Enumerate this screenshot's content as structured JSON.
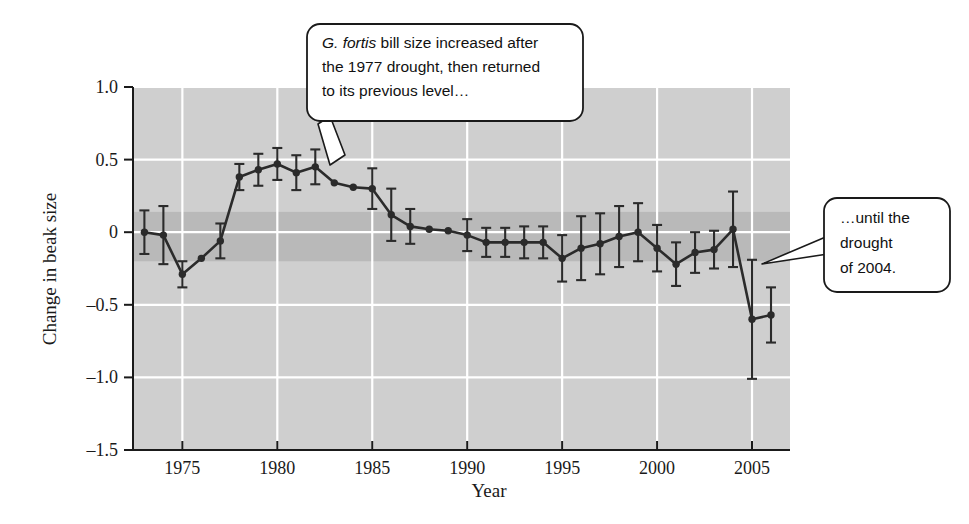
{
  "chart_data": {
    "type": "line",
    "title": "",
    "xlabel": "Year",
    "ylabel": "Change in beak size",
    "xlim": [
      1972.4,
      1907.0
    ],
    "ylim": [
      -1.5,
      1.0
    ],
    "x_ticks": [
      1975,
      1980,
      1985,
      1990,
      1995,
      2000,
      2005
    ],
    "y_ticks": [
      "1.0",
      "0.5",
      "0",
      "-0.5",
      "-1.0",
      "-1.5"
    ],
    "y_tick_values": [
      1.0,
      0.5,
      0,
      -0.5,
      -1.0,
      -1.5
    ],
    "grid": "horizontal and vertical white gridlines on gray panel",
    "legend": "none",
    "series": [
      {
        "name": "Change in beak size",
        "marker": "filled circle",
        "color": "#2b2b2b",
        "x": [
          1973,
          1974,
          1975,
          1976,
          1977,
          1978,
          1979,
          1980,
          1981,
          1982,
          1983,
          1984,
          1985,
          1986,
          1987,
          1988,
          1989,
          1990,
          1991,
          1992,
          1993,
          1994,
          1995,
          1996,
          1997,
          1998,
          1999,
          2000,
          2001,
          2002,
          2003,
          2004,
          2005,
          2006
        ],
        "values": [
          0.0,
          -0.02,
          -0.29,
          -0.18,
          -0.06,
          0.38,
          0.43,
          0.47,
          0.41,
          0.45,
          0.34,
          0.31,
          0.3,
          0.12,
          0.04,
          0.02,
          0.01,
          -0.02,
          -0.07,
          -0.07,
          -0.07,
          -0.07,
          -0.18,
          -0.11,
          -0.08,
          -0.03,
          0.0,
          -0.11,
          -0.22,
          -0.14,
          -0.12,
          0.02,
          -0.6,
          -0.57
        ],
        "errors": [
          0.15,
          0.2,
          0.09,
          0.0,
          0.12,
          0.09,
          0.11,
          0.11,
          0.12,
          0.12,
          0.0,
          0.0,
          0.14,
          0.18,
          0.12,
          0.0,
          0.0,
          0.11,
          0.1,
          0.1,
          0.11,
          0.11,
          0.16,
          0.22,
          0.21,
          0.21,
          0.2,
          0.16,
          0.15,
          0.14,
          0.13,
          0.26,
          0.41,
          0.19
        ]
      }
    ],
    "shaded_band": {
      "from": 0.14,
      "to": -0.2,
      "color": "#b9b9b9"
    },
    "panel_color": "#cfcfcf",
    "gridline_color": "#ffffff"
  },
  "annotations": {
    "callout1": {
      "name": "g-fortis-callout",
      "line1_italic": "G. fortis",
      "line1_rest": " bill size increased after",
      "line2": "the 1977 drought, then returned",
      "line3": "to its previous level…",
      "points_to_year": 1981
    },
    "callout2": {
      "name": "drought-2004-callout",
      "line1": "…until the",
      "line2": "drought",
      "line3": "of 2004.",
      "points_to_year": 2005
    }
  },
  "colors": {
    "panel": "#cfcfcf",
    "band": "#b9b9b9",
    "grid": "#ffffff",
    "line": "#2b2b2b",
    "axis": "#1a1a1a",
    "callout_fill": "#ffffff",
    "callout_stroke": "#1a1a1a"
  }
}
